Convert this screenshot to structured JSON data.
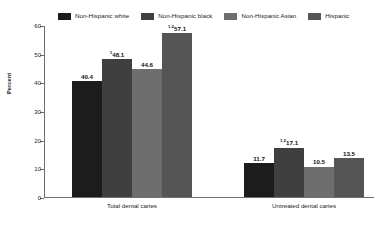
{
  "chart_data": {
    "type": "bar",
    "title": "",
    "subtitle": "",
    "xlabel": "",
    "ylabel": "Percent",
    "ylim": [
      0,
      60
    ],
    "ytick_step": 10,
    "yticks": [
      "0",
      "10",
      "20",
      "30",
      "40",
      "50",
      "60"
    ],
    "grid": false,
    "legend_position": "top",
    "categories": [
      "Total dental caries",
      "Untreated dental caries"
    ],
    "series": [
      {
        "name": "Non-Hispanic white",
        "color": "#1c1c1c",
        "values": [
          40.4,
          11.7
        ],
        "labels": [
          "40.4",
          "11.7"
        ],
        "footnotes": [
          "",
          ""
        ]
      },
      {
        "name": "Non-Hispanic black",
        "color": "#3f3f3f",
        "values": [
          48.1,
          17.1
        ],
        "labels": [
          "48.1",
          "17.1"
        ],
        "footnotes": [
          "1",
          "1,2"
        ]
      },
      {
        "name": "Non-Hispanic Asian",
        "color": "#6e6e6e",
        "values": [
          44.6,
          10.5
        ],
        "labels": [
          "44.6",
          "10.5"
        ],
        "footnotes": [
          "",
          ""
        ]
      },
      {
        "name": "Hispanic",
        "color": "#555555",
        "values": [
          57.1,
          13.5
        ],
        "labels": [
          "57.1",
          "13.5"
        ],
        "footnotes": [
          "1,2",
          ""
        ]
      }
    ]
  },
  "legend": {
    "items": [
      {
        "label": "Non-Hispanic white",
        "color": "#1c1c1c"
      },
      {
        "label": "Non-Hispanic black",
        "color": "#3f3f3f"
      },
      {
        "label": "Non-Hispanic Asian",
        "color": "#6e6e6e"
      },
      {
        "label": "Hispanic",
        "color": "#555555"
      }
    ]
  },
  "axis": {
    "y_title": "Percent",
    "y_ticks": [
      "60",
      "50",
      "40",
      "30",
      "20",
      "10",
      "0"
    ]
  },
  "x_categories": [
    "Total dental caries",
    "Untreated dental caries"
  ]
}
